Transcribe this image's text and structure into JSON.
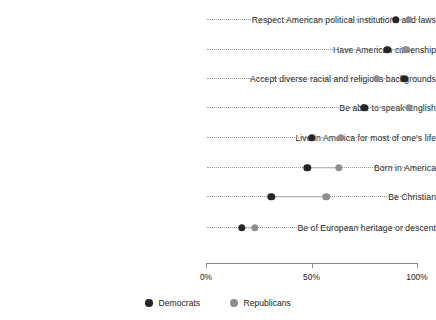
{
  "chart_data": {
    "type": "scatter",
    "subtype": "dumbbell-dot-plot",
    "title": "",
    "xlabel": "",
    "ylabel": "",
    "xlim": [
      0,
      100
    ],
    "xticks": [
      0,
      50,
      100
    ],
    "xtick_labels": [
      "0%",
      "50%",
      "100%"
    ],
    "grid": false,
    "legend_position": "bottom-center",
    "categories": [
      "Respect American political institutions and laws",
      "Have American citizenship",
      "Accept diverse racial and religious backgrounds",
      "Be able to speak English",
      "Live in America for most of one's life",
      "Born in America",
      "Be Christian",
      "Be of European heritage or descent"
    ],
    "series": [
      {
        "name": "Democrats",
        "color": "#262626",
        "values": [
          90,
          86,
          94,
          75,
          50,
          48,
          31,
          17
        ]
      },
      {
        "name": "Republicans",
        "color": "#8f8f8f",
        "values": [
          96,
          95,
          81,
          96,
          64,
          63,
          57,
          23
        ]
      }
    ]
  },
  "axis": {
    "ticks": [
      {
        "label": "0%",
        "value": 0
      },
      {
        "label": "50%",
        "value": 50
      },
      {
        "label": "100%",
        "value": 100
      }
    ]
  },
  "legend": {
    "items": [
      {
        "label": "Democrats",
        "color": "#262626",
        "marker": "filled-circle-icon"
      },
      {
        "label": "Republicans",
        "color": "#8f8f8f",
        "marker": "filled-circle-icon"
      }
    ]
  }
}
